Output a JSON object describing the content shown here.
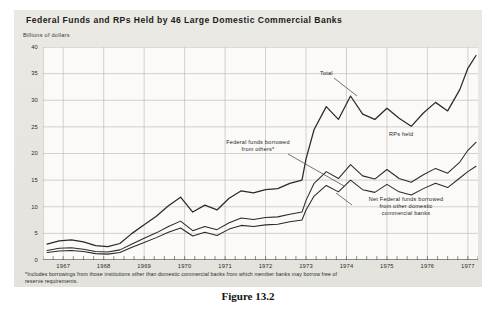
{
  "figure": {
    "caption": "Figure 13.2",
    "title": "Federal Funds and RPs Held by 46 Large Domestic Commercial Banks",
    "unit_label": "Billions of dollars",
    "footnote": "*Includes borrowings from those institutions other than domestic commercial banks from which member banks may borrow free of reserve requirements."
  },
  "annotations": {
    "total": "Total",
    "rps_held": "RPs held",
    "federal_funds_borrowed_line1": "Federal funds borrowed",
    "federal_funds_borrowed_line2": "from others*",
    "net_federal_line1": "Net Federal funds borrowed",
    "net_federal_line2": "from other domestic",
    "net_federal_line3": "commercial banks"
  },
  "colors": {
    "panel_background": "#e9e7e2",
    "plot_background": "#fbfaf8",
    "grid": "#b9b6b0",
    "line": "#2a2a2a",
    "text": "#1b1b1b"
  },
  "chart_data": {
    "type": "line",
    "title": "Federal Funds and RPs Held by 46 Large Domestic Commercial Banks",
    "xlabel": "",
    "ylabel": "Billions of dollars",
    "ylim": [
      0,
      40
    ],
    "yticks": [
      0,
      5,
      10,
      15,
      20,
      25,
      30,
      35,
      40
    ],
    "xlim": [
      1966.5,
      1977.25
    ],
    "xticks": [
      1967,
      1968,
      1969,
      1970,
      1971,
      1972,
      1973,
      1974,
      1975,
      1976,
      1977
    ],
    "xtick_labels": [
      "1967",
      "1968",
      "1969",
      "1970",
      "1971",
      "1972",
      "1973",
      "1974",
      "1975",
      "1976",
      "1977"
    ],
    "grid": true,
    "legend": "annotated-inline",
    "x": [
      1966.6,
      1966.9,
      1967.2,
      1967.5,
      1967.8,
      1968.1,
      1968.4,
      1968.7,
      1969.0,
      1969.3,
      1969.6,
      1969.9,
      1970.2,
      1970.5,
      1970.8,
      1971.1,
      1971.4,
      1971.7,
      1972.0,
      1972.3,
      1972.6,
      1972.9,
      1973.0,
      1973.2,
      1973.5,
      1973.8,
      1974.1,
      1974.4,
      1974.7,
      1975.0,
      1975.3,
      1975.6,
      1975.9,
      1976.2,
      1976.5,
      1976.8,
      1977.0,
      1977.2
    ],
    "series": [
      {
        "name": "Total",
        "label": "Total",
        "values": [
          3.0,
          3.6,
          3.8,
          3.4,
          2.7,
          2.5,
          3.1,
          5.0,
          6.6,
          8.2,
          10.2,
          11.8,
          9.0,
          10.3,
          9.4,
          11.6,
          13.0,
          12.6,
          13.2,
          13.4,
          14.4,
          15.0,
          19.0,
          24.5,
          28.8,
          26.4,
          30.8,
          27.4,
          26.4,
          28.5,
          26.6,
          25.1,
          27.6,
          29.6,
          28.0,
          32.0,
          36.0,
          38.4
        ]
      },
      {
        "name": "RPs held",
        "label": "RPs held",
        "values": [
          1.8,
          2.2,
          2.3,
          2.0,
          1.6,
          1.5,
          1.9,
          3.0,
          4.1,
          5.1,
          6.3,
          7.3,
          5.5,
          6.3,
          5.7,
          7.0,
          7.9,
          7.6,
          8.0,
          8.1,
          8.6,
          9.0,
          11.2,
          14.4,
          16.6,
          15.3,
          17.9,
          15.8,
          15.2,
          17.0,
          15.3,
          14.6,
          16.0,
          17.2,
          16.3,
          18.4,
          20.6,
          22.1
        ]
      },
      {
        "name": "Net Federal funds borrowed from other domestic commercial banks",
        "label": "Net Federal funds borrowed from other domestic commercial banks",
        "values": [
          1.4,
          1.7,
          1.8,
          1.6,
          1.2,
          1.1,
          1.4,
          2.4,
          3.3,
          4.2,
          5.2,
          6.0,
          4.5,
          5.2,
          4.6,
          5.8,
          6.5,
          6.3,
          6.6,
          6.7,
          7.2,
          7.5,
          9.4,
          12.0,
          14.0,
          12.8,
          15.0,
          13.2,
          12.7,
          14.2,
          12.8,
          12.2,
          13.4,
          14.4,
          13.6,
          15.4,
          16.6,
          17.6
        ]
      }
    ]
  }
}
